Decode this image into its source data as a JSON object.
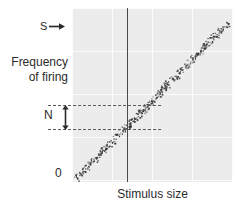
{
  "figure": {
    "background": "#ffffff",
    "plot_background": "#ececec",
    "ink_color": "#2b2b2b"
  },
  "labels": {
    "y_axis_line1": "Frequency",
    "y_axis_line2": "of firing",
    "x_axis": "Stimulus size",
    "origin": "0",
    "signal": "S",
    "noise": "N"
  },
  "annotations": {
    "signal_arrow_icon": "arrow-right-icon",
    "noise_arrow_icon": "arrow-updown-icon",
    "vertical_reference_line": true,
    "dashed_lines_count": 2
  },
  "chart_data": {
    "type": "scatter",
    "title": "",
    "xlabel": "Stimulus size",
    "ylabel": "Frequency of firing",
    "xlim": [
      0,
      100
    ],
    "ylim": [
      0,
      100
    ],
    "grid": true,
    "legend": null,
    "annotations": [
      {
        "name": "S",
        "text": "S",
        "type": "arrow-right",
        "x": -22,
        "y": 92
      },
      {
        "name": "N",
        "text": "N",
        "type": "arrow-updown",
        "x": -15,
        "y": 44
      },
      {
        "name": "origin",
        "text": "0",
        "x": -8,
        "y": 4
      }
    ],
    "reference_lines": [
      {
        "orientation": "vertical",
        "x": 34,
        "style": "solid",
        "color": "#4a4a4a"
      },
      {
        "orientation": "horizontal",
        "y": 50,
        "style": "dashed",
        "color": "#5a5a5a",
        "x_start": -15,
        "x_end": 55
      },
      {
        "orientation": "horizontal",
        "y": 36,
        "style": "dashed",
        "color": "#5a5a5a",
        "x_start": -15,
        "x_end": 55
      }
    ],
    "band": {
      "description": "Linear scatter band of neuronal firing points rising from lower-left to upper-right",
      "x_start": 2,
      "y_start": 2,
      "x_end": 97,
      "y_end": 92,
      "thickness": 9,
      "point_count": 430,
      "point_color": "#333333"
    },
    "points_note": "Points are distributed uniformly along a positively sloped band with vertical jitter representing response noise."
  }
}
